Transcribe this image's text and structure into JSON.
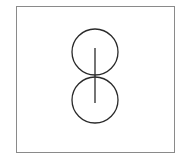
{
  "diagram": {
    "frame": {
      "x": 16.5,
      "y": 6.5,
      "width": 158,
      "height": 146,
      "stroke": "#8a8a8a"
    },
    "stroke_color": "#2a2a2a",
    "circles": [
      {
        "name": "top-circle",
        "cx": 95,
        "cy": 52,
        "r": 23
      },
      {
        "name": "bottom-circle",
        "cx": 95,
        "cy": 100,
        "r": 23
      }
    ],
    "line": {
      "x1": 95,
      "y1": 48,
      "x2": 95,
      "y2": 103
    }
  }
}
